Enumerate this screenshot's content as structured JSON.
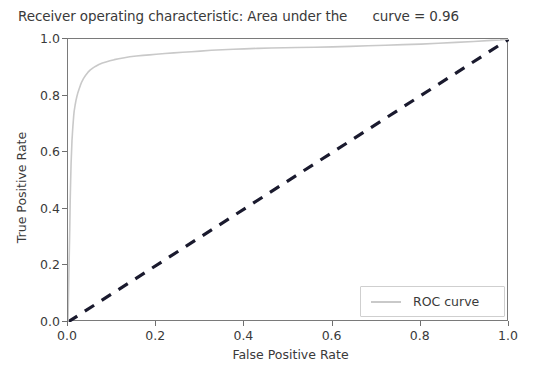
{
  "chart_data": {
    "type": "line",
    "title": "Receiver operating characteristic: Area under the      curve = 0.96",
    "xlabel": "False Positive Rate",
    "ylabel": "True Positive Rate",
    "xlim": [
      0.0,
      1.0
    ],
    "ylim": [
      0.0,
      1.0
    ],
    "xticks": [
      "0.0",
      "0.2",
      "0.4",
      "0.6",
      "0.8",
      "1.0"
    ],
    "xtick_values": [
      0.0,
      0.2,
      0.4,
      0.6,
      0.8,
      1.0
    ],
    "yticks": [
      "0.0",
      "0.2",
      "0.4",
      "0.6",
      "0.8",
      "1.0"
    ],
    "ytick_values": [
      0.0,
      0.2,
      0.4,
      0.6,
      0.8,
      1.0
    ],
    "grid": false,
    "legend_position": "lower right",
    "auc": 0.96,
    "colors": {
      "roc_curve": "#c9c9c9",
      "chance_line": "#1a1a2e",
      "axis": "#7a7a7a",
      "text": "#3a3a3a"
    },
    "series": [
      {
        "name": "ROC curve",
        "style": "solid",
        "color": "#c9c9c9",
        "x": [
          0.0,
          0.002,
          0.004,
          0.005,
          0.006,
          0.007,
          0.008,
          0.009,
          0.01,
          0.011,
          0.012,
          0.013,
          0.014,
          0.016,
          0.018,
          0.02,
          0.022,
          0.025,
          0.028,
          0.031,
          0.035,
          0.04,
          0.045,
          0.05,
          0.056,
          0.062,
          0.07,
          0.078,
          0.086,
          0.095,
          0.105,
          0.115,
          0.128,
          0.14,
          0.155,
          0.17,
          0.185,
          0.2,
          0.22,
          0.24,
          0.26,
          0.28,
          0.3,
          0.325,
          0.35,
          0.375,
          0.4,
          0.43,
          0.46,
          0.49,
          0.52,
          0.56,
          0.6,
          0.64,
          0.68,
          0.72,
          0.76,
          0.8,
          0.84,
          0.88,
          0.92,
          0.96,
          0.98,
          1.0
        ],
        "y": [
          0.0,
          0.17,
          0.33,
          0.43,
          0.5,
          0.56,
          0.6,
          0.64,
          0.665,
          0.69,
          0.71,
          0.73,
          0.745,
          0.765,
          0.782,
          0.796,
          0.808,
          0.822,
          0.836,
          0.848,
          0.86,
          0.872,
          0.882,
          0.89,
          0.897,
          0.903,
          0.91,
          0.915,
          0.919,
          0.923,
          0.927,
          0.93,
          0.934,
          0.937,
          0.94,
          0.942,
          0.944,
          0.946,
          0.949,
          0.951,
          0.953,
          0.955,
          0.957,
          0.96,
          0.962,
          0.964,
          0.965,
          0.967,
          0.968,
          0.969,
          0.97,
          0.971,
          0.972,
          0.974,
          0.976,
          0.978,
          0.98,
          0.982,
          0.985,
          0.988,
          0.991,
          0.995,
          0.997,
          1.0
        ]
      },
      {
        "name": "chance",
        "style": "dashed",
        "color": "#1a1a2e",
        "x": [
          0.0,
          1.0
        ],
        "y": [
          0.0,
          1.0
        ]
      }
    ]
  },
  "legend": {
    "entries": [
      {
        "label": "ROC curve"
      }
    ]
  }
}
